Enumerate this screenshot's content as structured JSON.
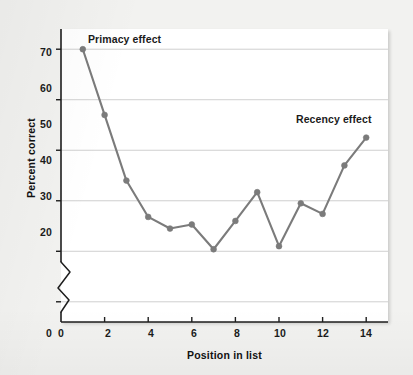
{
  "figure": {
    "background_color": "#f2f2f0",
    "plot_background_color": "#ffffff"
  },
  "chart_data": {
    "type": "line",
    "title": "",
    "subtitle": "",
    "xlabel": "Position in list",
    "ylabel": "Percent correct",
    "x": [
      1,
      2,
      3,
      4,
      5,
      6,
      7,
      8,
      9,
      10,
      11,
      12,
      13,
      14
    ],
    "values": [
      70.0,
      57.0,
      44.0,
      36.8,
      34.5,
      35.3,
      30.4,
      36.0,
      41.7,
      31.0,
      39.5,
      37.4,
      47.0,
      52.5
    ],
    "series": [
      {
        "name": "Percent correct",
        "color": "#7b7b7b",
        "marker": "circle",
        "values": [
          70.0,
          57.0,
          44.0,
          36.8,
          34.5,
          35.3,
          30.4,
          36.0,
          41.7,
          31.0,
          39.5,
          37.4,
          47.0,
          52.5
        ]
      }
    ],
    "xlim": [
      0,
      15
    ],
    "ylim": [
      16,
      74
    ],
    "y_axis_break": true,
    "y_axis_break_note": "axis broken between 0 and 20",
    "xticks": [
      "0",
      "2",
      "4",
      "6",
      "8",
      "10",
      "12",
      "14"
    ],
    "xtick_values": [
      0,
      2,
      4,
      6,
      8,
      10,
      12,
      14
    ],
    "yticks": [
      "20",
      "30",
      "40",
      "50",
      "60",
      "70"
    ],
    "ytick_values": [
      20,
      30,
      40,
      50,
      60,
      70
    ],
    "grid": "horizontal",
    "grid_color": "#c9c9c9",
    "legend": "none",
    "annotations": [
      {
        "id": "primacy",
        "text": "Primacy effect",
        "x": 1,
        "y": 73
      },
      {
        "id": "recency",
        "text": "Recency effect",
        "x": 12.6,
        "y": 57
      }
    ]
  },
  "axes": {
    "y_ticks": [
      {
        "label": "70"
      },
      {
        "label": "60"
      },
      {
        "label": "50"
      },
      {
        "label": "40"
      },
      {
        "label": "30"
      },
      {
        "label": "20"
      },
      {
        "label": "0"
      }
    ],
    "x_ticks": [
      {
        "label": "0"
      },
      {
        "label": "2"
      },
      {
        "label": "4"
      },
      {
        "label": "6"
      },
      {
        "label": "8"
      },
      {
        "label": "10"
      },
      {
        "label": "12"
      },
      {
        "label": "14"
      }
    ],
    "x_title": "Position in list",
    "y_title": "Percent correct"
  },
  "annotations": {
    "primacy": "Primacy effect",
    "recency": "Recency effect"
  },
  "colors": {
    "line": "#7b7b7b",
    "marker": "#7b7b7b",
    "grid": "#c9c9c9",
    "axis": "#1e1e1e",
    "text": "#1b1b1b"
  }
}
